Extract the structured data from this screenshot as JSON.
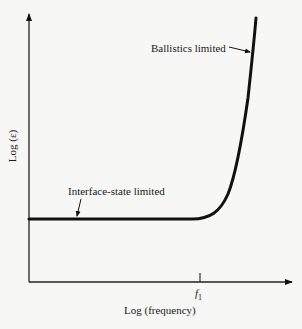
{
  "diagram": {
    "y_axis_label": "Log (ε)",
    "x_axis_label": "Log (frequency)",
    "x_tick_label_main": "f",
    "x_tick_label_sub": "1",
    "annotations": {
      "interface_state": "Interface-state limited",
      "ballistics": "Ballistics limited"
    },
    "colors": {
      "background": "#f7f7f5",
      "ink": "#111111"
    }
  }
}
